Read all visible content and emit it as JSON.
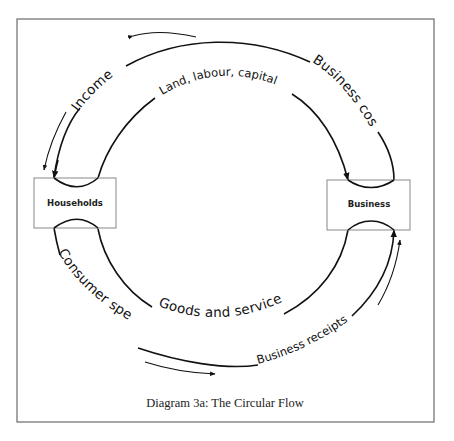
{
  "diagram": {
    "title": "Diagram 3a: The Circular Flow",
    "nodes": {
      "households": "Households",
      "business": "Business"
    },
    "flows": {
      "income": "Income",
      "business_costs": "Business costs",
      "factors": "Land, labour, capital",
      "consumer_spending": "Consumer spending",
      "goods_services": "Goods and services",
      "business_receipts": "Business receipts"
    },
    "colors": {
      "stroke": "#111111",
      "frame": "#666666",
      "box_border": "#888888"
    }
  }
}
